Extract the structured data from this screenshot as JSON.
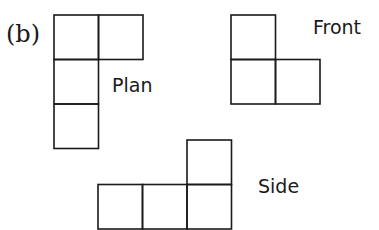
{
  "figure": {
    "part_label": "(b)",
    "views": [
      {
        "name": "Plan",
        "cells": [
          [
            0,
            0
          ],
          [
            1,
            0
          ],
          [
            0,
            1
          ],
          [
            0,
            2
          ]
        ]
      },
      {
        "name": "Front",
        "cells": [
          [
            0,
            0
          ],
          [
            0,
            1
          ],
          [
            1,
            1
          ]
        ]
      },
      {
        "name": "Side",
        "cells": [
          [
            2,
            0
          ],
          [
            0,
            1
          ],
          [
            1,
            1
          ],
          [
            2,
            1
          ]
        ]
      }
    ]
  }
}
